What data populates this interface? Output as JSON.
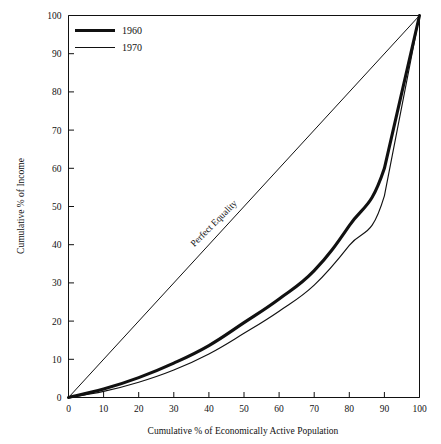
{
  "chart_data": {
    "type": "line",
    "title": "",
    "xlabel": "Cumulative % of Economically Active Population",
    "ylabel": "Cumulative % of Income",
    "xlim": [
      0,
      100
    ],
    "ylim": [
      0,
      100
    ],
    "grid": false,
    "legend_position": "top-left",
    "xticks": [
      0,
      10,
      20,
      30,
      40,
      50,
      60,
      70,
      80,
      90,
      100
    ],
    "yticks": [
      0,
      10,
      20,
      30,
      40,
      50,
      60,
      70,
      80,
      90,
      100
    ],
    "xtick_labels": [
      "0",
      "10",
      "20",
      "30",
      "40",
      "50",
      "60",
      "70",
      "80",
      "90",
      "100"
    ],
    "ytick_labels": [
      "0",
      "10",
      "20",
      "30",
      "40",
      "50",
      "60",
      "70",
      "80",
      "90",
      "100"
    ],
    "annotations": [
      {
        "text": "Perfect Equality",
        "x": 42,
        "y": 45,
        "rotation": -45
      }
    ],
    "reference_line": {
      "name": "Perfect Equality",
      "x": [
        0,
        100
      ],
      "y": [
        0,
        100
      ]
    },
    "x": [
      0,
      10,
      20,
      30,
      40,
      50,
      60,
      70,
      80,
      90,
      100
    ],
    "series": [
      {
        "name": "1960",
        "style": "thick",
        "values": [
          0,
          2.2,
          5.2,
          9.0,
          13.6,
          19.6,
          25.8,
          33.2,
          45.0,
          60.0,
          100
        ]
      },
      {
        "name": "1970",
        "style": "thin",
        "values": [
          0,
          1.6,
          4.0,
          7.2,
          11.4,
          16.8,
          22.6,
          29.4,
          39.8,
          52.8,
          100
        ]
      }
    ]
  },
  "legend": {
    "entries": [
      {
        "label": "1960",
        "style": "thick"
      },
      {
        "label": "1970",
        "style": "thin"
      }
    ]
  },
  "axes": {
    "x_title": "Cumulative % of Economically Active Population",
    "y_title": "Cumulative % of Income"
  }
}
